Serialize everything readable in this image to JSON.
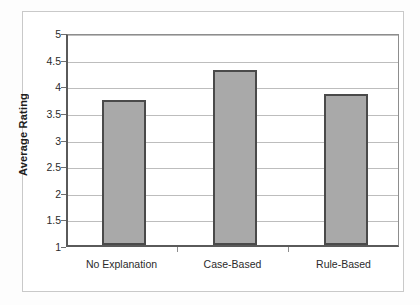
{
  "chart_data": {
    "type": "bar",
    "title": "",
    "categories": [
      "No Explanation",
      "Case-Based",
      "Rule-Based"
    ],
    "values": [
      3.73,
      4.28,
      3.83
    ],
    "xlabel": "",
    "ylabel": "Average Rating",
    "ylim": [
      1,
      5
    ],
    "ytick_labels": [
      "5",
      "4.5",
      "4",
      "3.5",
      "3",
      "2.5",
      "2",
      "1.5",
      "1"
    ],
    "ytick_values": [
      5,
      4.5,
      4,
      3.5,
      3,
      2.5,
      2,
      1.5,
      1
    ],
    "grid": true,
    "legend": "none",
    "bar_fill_color": "#a9a9a9",
    "bar_border_color": "#4a4a4a",
    "gridline_color": "#bdbdbd",
    "axis_color": "#5a5a5a",
    "plot_background": "#ffffff"
  }
}
